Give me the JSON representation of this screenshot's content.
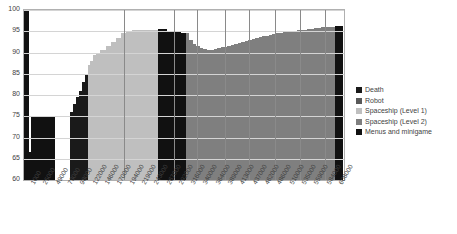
{
  "chart_data": {
    "type": "area",
    "title": "",
    "subtitle": "",
    "xlabel": "",
    "ylabel": "",
    "ylim": [
      60,
      100
    ],
    "grid": true,
    "legend_position": "right",
    "y_ticks": [
      "100",
      "95",
      "90",
      "85",
      "80",
      "75",
      "70",
      "65",
      "60"
    ],
    "x_ticks": [
      "1000",
      "25000",
      "49000",
      "73000",
      "98000",
      "122000",
      "146000",
      "170000",
      "194000",
      "219000",
      "243000",
      "267000",
      "292000",
      "316000",
      "340000",
      "364000",
      "389000",
      "413000",
      "437000",
      "462000",
      "486000",
      "510000",
      "535000",
      "559000",
      "584000",
      "608000"
    ],
    "series": [
      {
        "name": "Death",
        "color": "#1a1a1a"
      },
      {
        "name": "Robot",
        "color": "#595959"
      },
      {
        "name": "Spaceship (Level 1)",
        "color": "#bfbfbf"
      },
      {
        "name": "Spaceship (Level 2)",
        "color": "#7f7f7f"
      },
      {
        "name": "Menus and minigame",
        "color": "#111111"
      }
    ],
    "stacked_columns": [
      {
        "x": "1000",
        "width": 2.1,
        "segments": [
          {
            "series": "Menus and minigame",
            "top": 100.0
          }
        ]
      },
      {
        "x": "12000",
        "width": 1.0,
        "segments": [
          {
            "series": "Menus and minigame",
            "top": 66.5
          }
        ]
      },
      {
        "x": "25000",
        "width": 1.1,
        "segments": [
          {
            "series": "Menus and minigame",
            "top": 75.0
          }
        ]
      },
      {
        "x": "37000",
        "width": 5.0,
        "segments": [
          {
            "series": "Menus and minigame",
            "top": 75.0
          }
        ]
      },
      {
        "x": "73000",
        "width": 5.0,
        "segments": [
          {
            "series": "Menus and minigame",
            "top": 75.0
          }
        ]
      },
      {
        "x": "110000",
        "width": 5.2,
        "segments": [
          {
            "series": "Menus and minigame",
            "top": 60.0
          }
        ]
      },
      {
        "x": "150000",
        "width": 2.0,
        "segments": [
          {
            "series": "Menus and minigame",
            "top": 60.0
          }
        ]
      },
      {
        "x": "170000",
        "width": 1.4,
        "segments": [
          {
            "series": "Death",
            "top": 76.0
          }
        ]
      },
      {
        "x": "176000",
        "width": 1.4,
        "segments": [
          {
            "series": "Death",
            "top": 78.0
          }
        ]
      },
      {
        "x": "182000",
        "width": 1.4,
        "segments": [
          {
            "series": "Death",
            "top": 79.5
          }
        ]
      },
      {
        "x": "188000",
        "width": 1.4,
        "segments": [
          {
            "series": "Death",
            "top": 81.0
          }
        ]
      },
      {
        "x": "194000",
        "width": 1.2,
        "segments": [
          {
            "series": "Death",
            "top": 83.0
          }
        ]
      },
      {
        "x": "198000",
        "width": 1.2,
        "segments": [
          {
            "series": "Death",
            "top": 85.0
          }
        ]
      },
      {
        "x": "202000",
        "width": 1.2,
        "segments": [
          {
            "series": "Spaceship (Level 1)",
            "top": 87.0
          }
        ]
      },
      {
        "x": "206000",
        "width": 1.4,
        "segments": [
          {
            "series": "Spaceship (Level 1)",
            "top": 88.0
          }
        ]
      },
      {
        "x": "210000",
        "width": 1.4,
        "segments": [
          {
            "series": "Spaceship (Level 1)",
            "top": 89.5
          }
        ]
      },
      {
        "x": "214000",
        "width": 2.0,
        "segments": [
          {
            "series": "Spaceship (Level 1)",
            "top": 90.0
          }
        ]
      },
      {
        "x": "219000",
        "width": 2.4,
        "segments": [
          {
            "series": "Spaceship (Level 1)",
            "top": 90.5
          }
        ]
      },
      {
        "x": "226000",
        "width": 2.4,
        "segments": [
          {
            "series": "Spaceship (Level 1)",
            "top": 91.5
          }
        ]
      },
      {
        "x": "233000",
        "width": 2.4,
        "segments": [
          {
            "series": "Spaceship (Level 1)",
            "top": 92.5
          }
        ]
      },
      {
        "x": "240000",
        "width": 2.4,
        "segments": [
          {
            "series": "Spaceship (Level 1)",
            "top": 93.5
          }
        ]
      },
      {
        "x": "247000",
        "width": 2.4,
        "segments": [
          {
            "series": "Spaceship (Level 1)",
            "top": 94.5
          }
        ]
      },
      {
        "x": "254000",
        "width": 2.4,
        "segments": [
          {
            "series": "Spaceship (Level 1)",
            "top": 95.0
          }
        ]
      },
      {
        "x": "261000",
        "width": 3.0,
        "segments": [
          {
            "series": "Spaceship (Level 1)",
            "top": 95.2
          }
        ]
      },
      {
        "x": "270000",
        "width": 3.0,
        "segments": [
          {
            "series": "Spaceship (Level 1)",
            "top": 95.3
          }
        ]
      },
      {
        "x": "280000",
        "width": 3.0,
        "segments": [
          {
            "series": "Spaceship (Level 1)",
            "top": 95.4
          }
        ]
      },
      {
        "x": "290000",
        "width": 3.0,
        "segments": [
          {
            "series": "Spaceship (Level 1)",
            "top": 95.4
          }
        ]
      },
      {
        "x": "300000",
        "width": 2.2,
        "segments": [
          {
            "series": "Menus and minigame",
            "top": 95.5
          }
        ]
      },
      {
        "x": "306000",
        "width": 2.2,
        "segments": [
          {
            "series": "Menus and minigame",
            "top": 95.5
          }
        ]
      },
      {
        "x": "312000",
        "width": 2.2,
        "segments": [
          {
            "series": "Menus and minigame",
            "top": 95.0
          }
        ]
      },
      {
        "x": "318000",
        "width": 2.2,
        "segments": [
          {
            "series": "Menus and minigame",
            "top": 95.0
          }
        ]
      },
      {
        "x": "324000",
        "width": 2.2,
        "segments": [
          {
            "series": "Menus and minigame",
            "top": 94.8
          }
        ]
      },
      {
        "x": "330000",
        "width": 2.2,
        "segments": [
          {
            "series": "Menus and minigame",
            "top": 94.6
          }
        ]
      },
      {
        "x": "336000",
        "width": 1.6,
        "segments": [
          {
            "series": "Spaceship (Level 2)",
            "top": 94.5
          }
        ]
      },
      {
        "x": "340000",
        "width": 1.6,
        "segments": [
          {
            "series": "Spaceship (Level 2)",
            "top": 93.0
          }
        ]
      },
      {
        "x": "344000",
        "width": 1.6,
        "segments": [
          {
            "series": "Spaceship (Level 2)",
            "top": 92.0
          }
        ]
      },
      {
        "x": "348000",
        "width": 1.6,
        "segments": [
          {
            "series": "Spaceship (Level 2)",
            "top": 91.5
          }
        ]
      },
      {
        "x": "352000",
        "width": 1.6,
        "segments": [
          {
            "series": "Spaceship (Level 2)",
            "top": 91.0
          }
        ]
      },
      {
        "x": "356000",
        "width": 1.6,
        "segments": [
          {
            "series": "Spaceship (Level 2)",
            "top": 90.8
          }
        ]
      },
      {
        "x": "360000",
        "width": 1.6,
        "segments": [
          {
            "series": "Spaceship (Level 2)",
            "top": 90.5
          }
        ]
      },
      {
        "x": "364000",
        "width": 1.6,
        "segments": [
          {
            "series": "Spaceship (Level 2)",
            "top": 90.6
          }
        ]
      },
      {
        "x": "370000",
        "width": 1.6,
        "segments": [
          {
            "series": "Spaceship (Level 2)",
            "top": 90.8
          }
        ]
      },
      {
        "x": "376000",
        "width": 1.6,
        "segments": [
          {
            "series": "Spaceship (Level 2)",
            "top": 91.0
          }
        ]
      },
      {
        "x": "382000",
        "width": 1.6,
        "segments": [
          {
            "series": "Spaceship (Level 2)",
            "top": 91.2
          }
        ]
      },
      {
        "x": "389000",
        "width": 1.6,
        "segments": [
          {
            "series": "Spaceship (Level 2)",
            "top": 91.4
          }
        ]
      },
      {
        "x": "395000",
        "width": 1.6,
        "segments": [
          {
            "series": "Spaceship (Level 2)",
            "top": 91.6
          }
        ]
      },
      {
        "x": "401000",
        "width": 1.6,
        "segments": [
          {
            "series": "Spaceship (Level 2)",
            "top": 91.8
          }
        ]
      },
      {
        "x": "407000",
        "width": 1.6,
        "segments": [
          {
            "series": "Spaceship (Level 2)",
            "top": 92.0
          }
        ]
      },
      {
        "x": "413000",
        "width": 1.6,
        "segments": [
          {
            "series": "Spaceship (Level 2)",
            "top": 92.2
          }
        ]
      },
      {
        "x": "419000",
        "width": 1.6,
        "segments": [
          {
            "series": "Spaceship (Level 2)",
            "top": 92.4
          }
        ]
      },
      {
        "x": "425000",
        "width": 1.6,
        "segments": [
          {
            "series": "Spaceship (Level 2)",
            "top": 92.7
          }
        ]
      },
      {
        "x": "431000",
        "width": 1.6,
        "segments": [
          {
            "series": "Spaceship (Level 2)",
            "top": 93.0
          }
        ]
      },
      {
        "x": "437000",
        "width": 1.6,
        "segments": [
          {
            "series": "Spaceship (Level 2)",
            "top": 93.2
          }
        ]
      },
      {
        "x": "443000",
        "width": 1.6,
        "segments": [
          {
            "series": "Spaceship (Level 2)",
            "top": 93.4
          }
        ]
      },
      {
        "x": "449000",
        "width": 1.6,
        "segments": [
          {
            "series": "Spaceship (Level 2)",
            "top": 93.6
          }
        ]
      },
      {
        "x": "455000",
        "width": 1.6,
        "segments": [
          {
            "series": "Spaceship (Level 2)",
            "top": 93.8
          }
        ]
      },
      {
        "x": "462000",
        "width": 1.6,
        "segments": [
          {
            "series": "Spaceship (Level 2)",
            "top": 94.0
          }
        ]
      },
      {
        "x": "468000",
        "width": 1.6,
        "segments": [
          {
            "series": "Spaceship (Level 2)",
            "top": 94.2
          }
        ]
      },
      {
        "x": "474000",
        "width": 1.6,
        "segments": [
          {
            "series": "Spaceship (Level 2)",
            "top": 94.3
          }
        ]
      },
      {
        "x": "480000",
        "width": 1.6,
        "segments": [
          {
            "series": "Spaceship (Level 2)",
            "top": 94.5
          }
        ]
      },
      {
        "x": "486000",
        "width": 1.6,
        "segments": [
          {
            "series": "Spaceship (Level 2)",
            "top": 94.6
          }
        ]
      },
      {
        "x": "492000",
        "width": 1.6,
        "segments": [
          {
            "series": "Spaceship (Level 2)",
            "top": 94.8
          }
        ]
      },
      {
        "x": "498000",
        "width": 1.6,
        "segments": [
          {
            "series": "Spaceship (Level 2)",
            "top": 94.9
          }
        ]
      },
      {
        "x": "504000",
        "width": 1.6,
        "segments": [
          {
            "series": "Spaceship (Level 2)",
            "top": 95.0
          }
        ]
      },
      {
        "x": "510000",
        "width": 1.6,
        "segments": [
          {
            "series": "Spaceship (Level 2)",
            "top": 95.1
          }
        ]
      },
      {
        "x": "516000",
        "width": 1.6,
        "segments": [
          {
            "series": "Spaceship (Level 2)",
            "top": 95.2
          }
        ]
      },
      {
        "x": "522000",
        "width": 1.6,
        "segments": [
          {
            "series": "Spaceship (Level 2)",
            "top": 95.3
          }
        ]
      },
      {
        "x": "528000",
        "width": 1.6,
        "segments": [
          {
            "series": "Spaceship (Level 2)",
            "top": 95.4
          }
        ]
      },
      {
        "x": "535000",
        "width": 1.6,
        "segments": [
          {
            "series": "Spaceship (Level 2)",
            "top": 95.5
          }
        ]
      },
      {
        "x": "541000",
        "width": 1.6,
        "segments": [
          {
            "series": "Spaceship (Level 2)",
            "top": 95.6
          }
        ]
      },
      {
        "x": "547000",
        "width": 1.6,
        "segments": [
          {
            "series": "Spaceship (Level 2)",
            "top": 95.7
          }
        ]
      },
      {
        "x": "553000",
        "width": 1.6,
        "segments": [
          {
            "series": "Spaceship (Level 2)",
            "top": 95.8
          }
        ]
      },
      {
        "x": "559000",
        "width": 1.6,
        "segments": [
          {
            "series": "Spaceship (Level 2)",
            "top": 95.9
          }
        ]
      },
      {
        "x": "566000",
        "width": 1.6,
        "segments": [
          {
            "series": "Spaceship (Level 2)",
            "top": 96.0
          }
        ]
      },
      {
        "x": "573000",
        "width": 1.6,
        "segments": [
          {
            "series": "Spaceship (Level 2)",
            "top": 96.0
          }
        ]
      },
      {
        "x": "580000",
        "width": 1.6,
        "segments": [
          {
            "series": "Spaceship (Level 2)",
            "top": 96.1
          }
        ]
      },
      {
        "x": "590000",
        "width": 1.4,
        "segments": [
          {
            "series": "Menus and minigame",
            "top": 96.2
          }
        ]
      },
      {
        "x": "600000",
        "width": 1.4,
        "segments": [
          {
            "series": "Menus and minigame",
            "top": 96.2
          }
        ]
      },
      {
        "x": "608000",
        "width": 1.2,
        "segments": [
          {
            "series": "Menus and minigame",
            "top": 96.2
          }
        ]
      }
    ],
    "vertical_markers": [
      "194000",
      "292000",
      "336000",
      "389000",
      "437000",
      "486000",
      "535000",
      "584000"
    ]
  },
  "legend": {
    "items": [
      {
        "label": "Death"
      },
      {
        "label": "Robot"
      },
      {
        "label": "Spaceship (Level 1)"
      },
      {
        "label": "Spaceship (Level 2)"
      },
      {
        "label": "Menus and minigame"
      }
    ]
  }
}
